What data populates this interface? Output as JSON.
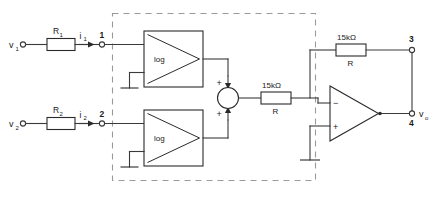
{
  "diagram": {
    "type": "schematic"
  },
  "inputs": [
    {
      "source_label": "v",
      "source_sub": "1",
      "resistor_label": "R",
      "resistor_sub": "1",
      "current_label": "i",
      "current_sub": "1",
      "node_label": "1",
      "block_label": "log"
    },
    {
      "source_label": "v",
      "source_sub": "2",
      "resistor_label": "R",
      "resistor_sub": "2",
      "current_label": "i",
      "current_sub": "2",
      "node_label": "2",
      "block_label": "log"
    }
  ],
  "summer": {
    "top_sign": "+",
    "bottom_sign": "+"
  },
  "series_resistor": {
    "value": "15kΩ",
    "name": "R"
  },
  "feedback_resistor": {
    "value": "15kΩ",
    "name": "R"
  },
  "opamp": {
    "inverting_sign": "−",
    "noninverting_sign": "+"
  },
  "outputs": {
    "node_top": "3",
    "node_bottom": "4",
    "signal_label": "v",
    "signal_sub": "o"
  },
  "colors": {
    "wire": "#3a3a3a",
    "body": "#2a2a2a",
    "dashed_boundary": "#9a9a9a",
    "background": "#ffffff"
  }
}
